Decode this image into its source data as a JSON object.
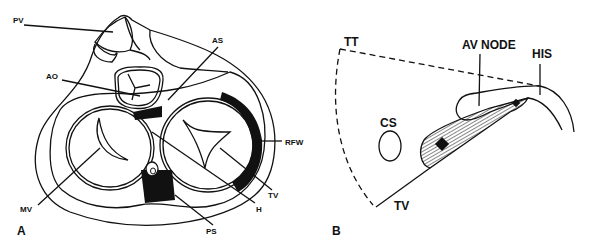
{
  "figure": {
    "panel_a": {
      "panel_label": "A",
      "labels": {
        "pv": "PV",
        "ao": "AO",
        "as": "AS",
        "rfw": "RFW",
        "mv": "MV",
        "tv": "TV",
        "h": "H",
        "ps": "PS"
      }
    },
    "panel_b": {
      "panel_label": "B",
      "labels": {
        "tt": "TT",
        "av_node": "AV NODE",
        "his": "HIS",
        "cs": "CS",
        "tv": "TV"
      }
    },
    "colors": {
      "line": "#111111",
      "background": "#ffffff"
    }
  }
}
